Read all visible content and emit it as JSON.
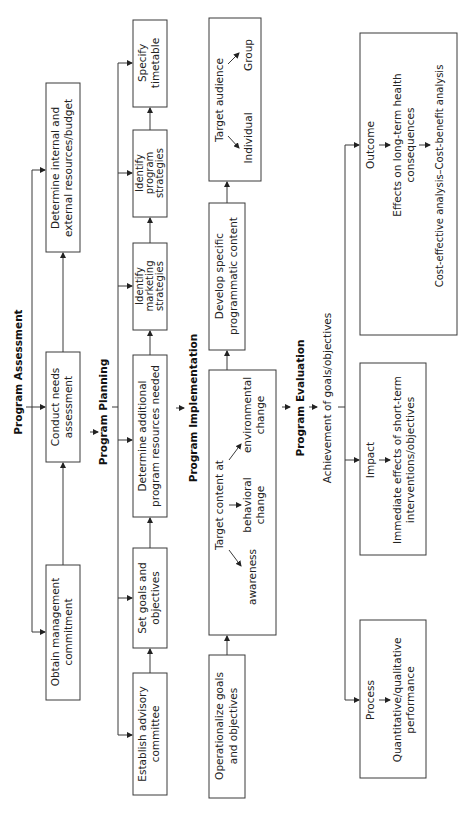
{
  "diagram": {
    "orientation": "rotated-90-ccw",
    "sections": {
      "assessment": {
        "title": "Program Assessment",
        "boxes": [
          {
            "line1": "Obtain management",
            "line2": "commitment"
          },
          {
            "line1": "Conduct needs",
            "line2": "assessment"
          },
          {
            "line1": "Determine internal and",
            "line2": "external resources/budget"
          }
        ]
      },
      "planning": {
        "title": "Program Planning",
        "boxes": [
          {
            "line1": "Establish advisory",
            "line2": "committee"
          },
          {
            "line1": "Set goals and",
            "line2": "objectives"
          },
          {
            "line1": "Determine additional",
            "line2": "program resources needed"
          },
          {
            "line1": "Identify",
            "line2": "marketing",
            "line3": "strategies"
          },
          {
            "line1": "Identify",
            "line2": "program",
            "line3": "strategies"
          },
          {
            "line1": "Specify",
            "line2": "timetable"
          }
        ]
      },
      "implementation": {
        "title": "Program Implementation",
        "boxes": [
          {
            "line1": "Operationalize goals",
            "line2": "and objectives"
          },
          {
            "heading": "Target content at",
            "items": [
              {
                "line1": "awareness"
              },
              {
                "line1": "behavioral",
                "line2": "change"
              },
              {
                "line1": "environmental",
                "line2": "change"
              }
            ]
          },
          {
            "line1": "Develop specific",
            "line2": "programmatic content"
          },
          {
            "heading": "Target audience",
            "items": [
              {
                "line1": "Individual"
              },
              {
                "line1": "Group"
              }
            ]
          }
        ]
      },
      "evaluation": {
        "title": "Program Evaluation",
        "subtitle": "Achievement of goals/objectives",
        "boxes": [
          {
            "title": "Process",
            "line1": "Quantitative/qualitative",
            "line2": "performance"
          },
          {
            "title": "Impact",
            "line1": "Immediate effects of short-term",
            "line2": "interventions/objectives"
          },
          {
            "title": "Outcome",
            "line1": "Effects on long-term health",
            "line2": "consequences",
            "line3": "Cost-effective analysis–Cost-benefit analysis"
          }
        ]
      }
    }
  }
}
